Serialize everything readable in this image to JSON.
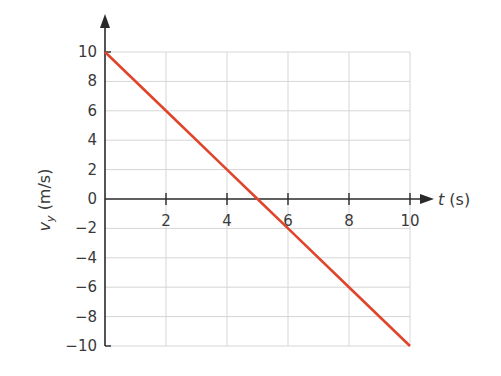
{
  "chart_data": {
    "type": "line",
    "title": "",
    "xlabel": "t (s)",
    "ylabel": "v_y (m/s)",
    "xlim": [
      0,
      10
    ],
    "ylim": [
      -10,
      10
    ],
    "grid": true,
    "x_ticks": [
      2,
      4,
      6,
      8,
      10
    ],
    "y_ticks": [
      10,
      8,
      6,
      4,
      2,
      0,
      -2,
      -4,
      -6,
      -8,
      -10
    ],
    "series": [
      {
        "name": "v_y",
        "color": "#e0452c",
        "x": [
          0,
          2,
          4,
          5,
          6,
          8,
          10
        ],
        "y": [
          10,
          6,
          2,
          0,
          -2,
          -6,
          -10
        ]
      }
    ]
  },
  "labels": {
    "x_axis_var": "t",
    "x_axis_unit": " (s)",
    "y_axis_var": "v",
    "y_axis_sub": "y",
    "y_axis_unit": " (m/s)",
    "x_ticks": [
      "2",
      "4",
      "6",
      "8",
      "10"
    ],
    "y_ticks": [
      "10",
      "8",
      "6",
      "4",
      "2",
      "0",
      "−2",
      "−4",
      "−6",
      "−8",
      "−10"
    ]
  }
}
